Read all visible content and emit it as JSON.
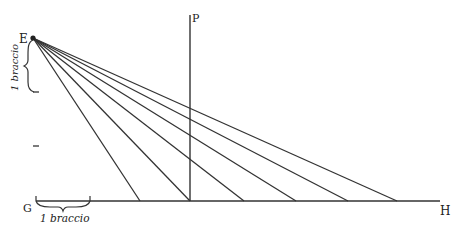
{
  "diagram": {
    "labels": {
      "E": "E",
      "P": "P",
      "G": "G",
      "H": "H"
    },
    "measure_vertical": "1 braccio",
    "measure_horizontal": "1 braccio",
    "eye_point": [
      33,
      38
    ],
    "baseline_y": 201,
    "ray_endpoints_x": [
      140,
      190,
      244,
      296,
      348,
      397
    ],
    "picture_plane_x": 190,
    "line_color": "#333333"
  }
}
